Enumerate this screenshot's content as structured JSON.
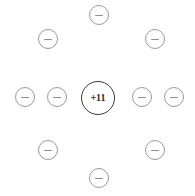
{
  "diagram": {
    "type": "atomic-shell-diagram",
    "background_color": "#ffffff",
    "width": 195,
    "height": 196
  },
  "nucleus": {
    "label": "+11",
    "charge": 11,
    "element": "Na",
    "cx": 98,
    "cy": 98,
    "diameter": 34,
    "stroke_color": "#3a3a3a",
    "stroke_width": 1.6,
    "fill_color": "#ffffff",
    "text_color": "#2b2b2b",
    "font_size": 10
  },
  "electron_style": {
    "diameter": 20,
    "stroke_color": "#9a9a9a",
    "stroke_width": 1,
    "fill_color": "#ffffff",
    "sign_color": "#8e8e8e",
    "sign_width": 8,
    "sign_height": 1,
    "sign_label": "minus"
  },
  "electrons": [
    {
      "id": "electron-top",
      "position": "top",
      "cx": 99,
      "cy": 15,
      "sign": "minus"
    },
    {
      "id": "electron-top-left",
      "position": "top-left",
      "cx": 48,
      "cy": 39,
      "sign": "minus"
    },
    {
      "id": "electron-top-right",
      "position": "top-right",
      "cx": 155,
      "cy": 39,
      "sign": "minus"
    },
    {
      "id": "electron-left-outer",
      "position": "left-outer",
      "cx": 25,
      "cy": 97,
      "sign": "minus"
    },
    {
      "id": "electron-left-inner",
      "position": "left-inner",
      "cx": 57,
      "cy": 97,
      "sign": "minus"
    },
    {
      "id": "electron-right-inner",
      "position": "right-inner",
      "cx": 142,
      "cy": 97,
      "sign": "minus"
    },
    {
      "id": "electron-right-outer",
      "position": "right-outer",
      "cx": 174,
      "cy": 97,
      "sign": "minus"
    },
    {
      "id": "electron-bottom-left",
      "position": "bottom-left",
      "cx": 48,
      "cy": 150,
      "sign": "minus"
    },
    {
      "id": "electron-bottom-right",
      "position": "bottom-right",
      "cx": 155,
      "cy": 150,
      "sign": "minus"
    },
    {
      "id": "electron-bottom",
      "position": "bottom",
      "cx": 99,
      "cy": 178,
      "sign": "minus"
    }
  ],
  "counts": {
    "electron_count": 10,
    "proton_count": 11
  }
}
